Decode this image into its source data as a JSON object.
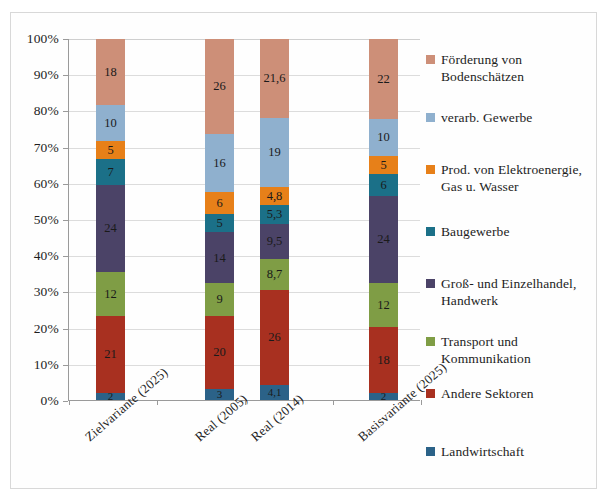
{
  "chart_data": {
    "type": "bar",
    "subtype": "stacked-100-percent",
    "title": "",
    "xlabel": "",
    "ylabel": "",
    "ylim": [
      0,
      100
    ],
    "ytick_labels": [
      "0%",
      "10%",
      "20%",
      "30%",
      "40%",
      "50%",
      "60%",
      "70%",
      "80%",
      "90%",
      "100%"
    ],
    "ytick_values": [
      0,
      10,
      20,
      30,
      40,
      50,
      60,
      70,
      80,
      90,
      100
    ],
    "grid": true,
    "legend_position": "right",
    "categories": [
      "Zielvariante (2025)",
      "Real (2005)",
      "Real (2014)",
      "Basisvariante (2025)"
    ],
    "series": [
      {
        "name": "Landwirtschaft",
        "color": "#2b6288",
        "values": [
          2,
          3,
          4.1,
          2
        ],
        "labels": [
          "2",
          "3",
          "4,1",
          "2"
        ]
      },
      {
        "name": "Andere Sektoren",
        "color": "#a83020",
        "values": [
          21,
          20,
          26,
          18
        ],
        "labels": [
          "21",
          "20",
          "26",
          "18"
        ]
      },
      {
        "name": "Transport und Kommunikation",
        "color": "#7f9d45",
        "values": [
          12,
          9,
          8.7,
          12
        ],
        "labels": [
          "12",
          "9",
          "8,7",
          "12"
        ]
      },
      {
        "name": "Groß- und Einzelhandel, Handwerk",
        "color": "#4b4367",
        "values": [
          24,
          14,
          9.5,
          24
        ],
        "labels": [
          "24",
          "14",
          "9,5",
          "24"
        ]
      },
      {
        "name": "Baugewerbe",
        "color": "#1b7088",
        "values": [
          7,
          5,
          5.3,
          6
        ],
        "labels": [
          "7",
          "5",
          "5,3",
          "6"
        ]
      },
      {
        "name": "Prod. von Elektroenergie, Gas u. Wasser",
        "color": "#e78019",
        "values": [
          5,
          6,
          4.8,
          5
        ],
        "labels": [
          "5",
          "6",
          "4,8",
          "5"
        ]
      },
      {
        "name": "verarb. Gewerbe",
        "color": "#8fb0ce",
        "values": [
          10,
          16,
          19,
          10
        ],
        "labels": [
          "10",
          "16",
          "19",
          "10"
        ]
      },
      {
        "name": "Förderung von Bodenschätzen",
        "color": "#cd8f78",
        "values": [
          18,
          26,
          21.6,
          22
        ],
        "labels": [
          "18",
          "26",
          "21,6",
          "22"
        ]
      }
    ]
  },
  "legend": {
    "entries": [
      {
        "label_line1": "Förderung von",
        "label_line2": "Bodenschätzen",
        "color": "#cd8f78"
      },
      {
        "label_line1": "verarb. Gewerbe",
        "label_line2": "",
        "color": "#8fb0ce"
      },
      {
        "label_line1": "Prod. von Elektroenergie,",
        "label_line2": "Gas u. Wasser",
        "color": "#e78019"
      },
      {
        "label_line1": "Baugewerbe",
        "label_line2": "",
        "color": "#1b7088"
      },
      {
        "label_line1": "Groß- und Einzelhandel,",
        "label_line2": "Handwerk",
        "color": "#4b4367"
      },
      {
        "label_line1": "Transport und",
        "label_line2": "Kommunikation",
        "color": "#7f9d45"
      },
      {
        "label_line1": "Andere Sektoren",
        "label_line2": "",
        "color": "#a83020"
      },
      {
        "label_line1": "Landwirtschaft",
        "label_line2": "",
        "color": "#2b6288"
      }
    ]
  }
}
